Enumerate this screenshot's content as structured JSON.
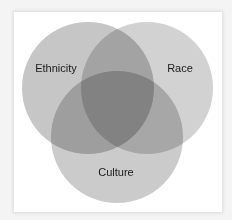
{
  "diagram": {
    "type": "venn",
    "sets": [
      {
        "id": "ethnicity",
        "label": "Ethnicity"
      },
      {
        "id": "race",
        "label": "Race"
      },
      {
        "id": "culture",
        "label": "Culture"
      }
    ],
    "colors": {
      "circle": "#b4b4b4",
      "background": "#ffffff"
    }
  }
}
